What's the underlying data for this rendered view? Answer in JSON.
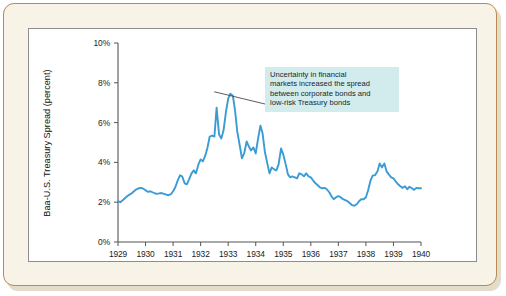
{
  "figure": {
    "panel_background": "#ffffff",
    "card_background": "#f7f3e6",
    "card_border_color": "#b98a52",
    "panel_border_color": "#8d8d8d"
  },
  "annotation": {
    "background_color": "#d2ecee",
    "leader_line_color": "#4a4a4a",
    "lines": [
      "Uncertainty in financial",
      "markets increased the spread",
      "between corporate bonds and",
      "low-risk Treasury bonds"
    ],
    "target_x_value": 1932.42,
    "target_y_value": 7.5
  },
  "chart_data": {
    "type": "line",
    "title": "",
    "subtitle": "",
    "xlabel": "",
    "ylabel": "Baa-U.S. Treasury Spread (percent)",
    "series_color": "#3a9bd5",
    "line_width": 1.9,
    "grid": false,
    "legend": "none",
    "xlim": [
      1929,
      1940
    ],
    "ylim": [
      0,
      10
    ],
    "x_tick_labels": [
      "1929",
      "1930",
      "1931",
      "1932",
      "1933",
      "1934",
      "1935",
      "1936",
      "1937",
      "1938",
      "1939",
      "1940"
    ],
    "x_ticks": [
      1929,
      1930,
      1931,
      1932,
      1933,
      1934,
      1935,
      1936,
      1937,
      1938,
      1939,
      1940
    ],
    "y_tick_labels": [
      "0%",
      "2%",
      "4%",
      "6%",
      "8%",
      "10%"
    ],
    "y_ticks": [
      0,
      2,
      4,
      6,
      8,
      10
    ],
    "series": [
      {
        "name": "Baa-U.S. Treasury Spread",
        "x": [
          1929.0,
          1929.08,
          1929.17,
          1929.25,
          1929.33,
          1929.42,
          1929.5,
          1929.58,
          1929.67,
          1929.75,
          1929.83,
          1929.92,
          1930.0,
          1930.08,
          1930.17,
          1930.25,
          1930.33,
          1930.42,
          1930.5,
          1930.58,
          1930.67,
          1930.75,
          1930.83,
          1930.92,
          1931.0,
          1931.08,
          1931.17,
          1931.25,
          1931.33,
          1931.42,
          1931.5,
          1931.58,
          1931.67,
          1931.75,
          1931.83,
          1931.92,
          1932.0,
          1932.08,
          1932.17,
          1932.25,
          1932.33,
          1932.42,
          1932.5,
          1932.58,
          1932.67,
          1932.75,
          1932.83,
          1932.92,
          1933.0,
          1933.08,
          1933.17,
          1933.25,
          1933.33,
          1933.42,
          1933.5,
          1933.58,
          1933.67,
          1933.75,
          1933.83,
          1933.92,
          1934.0,
          1934.08,
          1934.17,
          1934.25,
          1934.33,
          1934.42,
          1934.5,
          1934.58,
          1934.67,
          1934.75,
          1934.83,
          1934.92,
          1935.0,
          1935.08,
          1935.17,
          1935.25,
          1935.33,
          1935.42,
          1935.5,
          1935.58,
          1935.67,
          1935.75,
          1935.83,
          1935.92,
          1936.0,
          1936.08,
          1936.17,
          1936.25,
          1936.33,
          1936.42,
          1936.5,
          1936.58,
          1936.67,
          1936.75,
          1936.83,
          1936.92,
          1937.0,
          1937.08,
          1937.17,
          1937.25,
          1937.33,
          1937.42,
          1937.5,
          1937.58,
          1937.67,
          1937.75,
          1937.83,
          1937.92,
          1938.0,
          1938.08,
          1938.17,
          1938.25,
          1938.33,
          1938.42,
          1938.5,
          1938.58,
          1938.67,
          1938.75,
          1938.83,
          1938.92,
          1939.0,
          1939.08,
          1939.17,
          1939.25,
          1939.33,
          1939.42,
          1939.5,
          1939.58,
          1939.67,
          1939.75,
          1939.83,
          1939.92,
          1940.0
        ],
        "values": [
          2.05,
          2.0,
          2.1,
          2.2,
          2.3,
          2.38,
          2.45,
          2.55,
          2.65,
          2.7,
          2.72,
          2.68,
          2.6,
          2.52,
          2.55,
          2.5,
          2.45,
          2.42,
          2.44,
          2.46,
          2.42,
          2.38,
          2.35,
          2.4,
          2.55,
          2.75,
          3.1,
          3.35,
          3.3,
          2.95,
          2.9,
          3.15,
          3.45,
          3.6,
          3.45,
          3.9,
          4.15,
          4.05,
          4.35,
          4.75,
          5.3,
          5.35,
          5.3,
          6.75,
          5.4,
          5.2,
          5.6,
          6.55,
          7.2,
          7.45,
          7.35,
          6.6,
          5.55,
          4.85,
          4.2,
          4.45,
          5.05,
          4.8,
          4.6,
          4.75,
          4.45,
          5.15,
          5.85,
          5.45,
          4.55,
          3.95,
          3.45,
          3.75,
          3.65,
          3.6,
          3.9,
          4.7,
          4.4,
          3.95,
          3.4,
          3.25,
          3.3,
          3.25,
          3.2,
          3.45,
          3.4,
          3.3,
          3.45,
          3.3,
          3.25,
          3.1,
          2.95,
          2.85,
          2.75,
          2.7,
          2.72,
          2.65,
          2.5,
          2.3,
          2.15,
          2.25,
          2.3,
          2.25,
          2.15,
          2.1,
          2.05,
          1.95,
          1.85,
          1.82,
          1.9,
          2.05,
          2.15,
          2.15,
          2.25,
          2.6,
          3.1,
          3.35,
          3.35,
          3.55,
          3.95,
          3.75,
          3.95,
          3.55,
          3.4,
          3.25,
          3.2,
          3.05,
          2.9,
          2.8,
          2.72,
          2.8,
          2.65,
          2.78,
          2.7,
          2.62,
          2.72,
          2.7,
          2.7
        ]
      }
    ],
    "annotations": [
      {
        "text": "Uncertainty in financial markets increased the spread between corporate bonds and low-risk Treasury bonds",
        "points_to_x": 1932.42,
        "points_to_y": 7.5
      }
    ]
  }
}
